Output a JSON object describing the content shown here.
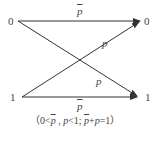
{
  "diagram": {
    "inputs": [
      {
        "label": "0"
      },
      {
        "label": "1"
      }
    ],
    "outputs": [
      {
        "label": "0"
      },
      {
        "label": "1"
      }
    ],
    "edges": [
      {
        "from": "0",
        "to": "0",
        "label": "p̄",
        "label_symbol": "p",
        "overline": true
      },
      {
        "from": "1",
        "to": "0",
        "label": "p",
        "label_symbol": "p",
        "overline": false
      },
      {
        "from": "0",
        "to": "1",
        "label": "p",
        "label_symbol": "p",
        "overline": false
      },
      {
        "from": "1",
        "to": "1",
        "label": "p̄",
        "label_symbol": "p",
        "overline": true
      }
    ],
    "caption": {
      "open": "（0<",
      "pbar1": "p",
      "mid1": " , ",
      "p1": "p",
      "mid2": "<1; ",
      "pbar2": "p",
      "plus": "+",
      "p2": "p",
      "close": "=1）",
      "full_text": "（0<p̄ , p<1; p̄+p=1）"
    },
    "colors": {
      "line": "#333333",
      "text": "#444444",
      "background": "#ffffff"
    }
  }
}
